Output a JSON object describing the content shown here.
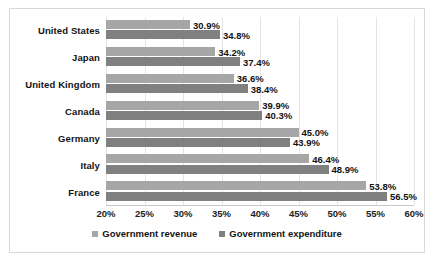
{
  "chart_data": {
    "type": "bar",
    "orientation": "horizontal",
    "title": "",
    "xlabel": "",
    "ylabel": "",
    "xlim": [
      20,
      60
    ],
    "xticks": [
      "20%",
      "25%",
      "30%",
      "35%",
      "40%",
      "45%",
      "50%",
      "55%",
      "60%"
    ],
    "grid": true,
    "legend_position": "bottom",
    "categories": [
      "United States",
      "Japan",
      "United Kingdom",
      "Canada",
      "Germany",
      "Italy",
      "France"
    ],
    "series": [
      {
        "name": "Government revenue",
        "color": "#a6a6a6",
        "values": [
          30.9,
          34.2,
          36.6,
          39.9,
          45.0,
          46.4,
          53.8
        ],
        "labels": [
          "30.9%",
          "34.2%",
          "36.6%",
          "39.9%",
          "45.0%",
          "46.4%",
          "53.8%"
        ]
      },
      {
        "name": "Government expenditure",
        "color": "#808080",
        "values": [
          34.8,
          37.4,
          38.4,
          40.3,
          43.9,
          48.9,
          56.5
        ],
        "labels": [
          "34.8%",
          "37.4%",
          "38.4%",
          "40.3%",
          "43.9%",
          "48.9%",
          "56.5%"
        ]
      }
    ]
  },
  "legend": {
    "items": [
      {
        "label": "Government revenue",
        "marker": "square-swatch-icon"
      },
      {
        "label": "Government expenditure",
        "marker": "square-swatch-icon"
      }
    ]
  }
}
